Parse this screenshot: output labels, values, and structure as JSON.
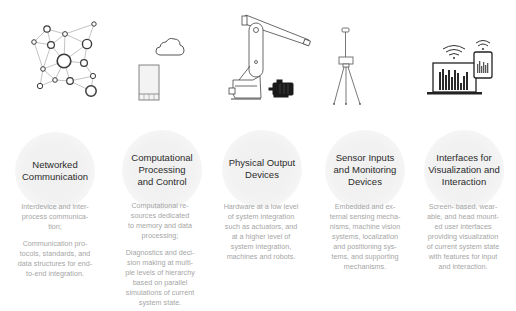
{
  "columns": [
    {
      "id": "networked",
      "icon": "network-graph-icon",
      "title": "Networked\nCommunication",
      "paragraphs": [
        "Interdevice and inter-\nprocess communica-\ntion;",
        "Communication pro-\ntocols, standards, and\ndata structures for end-\nto-end integration."
      ]
    },
    {
      "id": "computational",
      "icon": "cloud-server-icon",
      "title": "Computational\nProcessing\nand Control",
      "paragraphs": [
        "Computational re-\nsources dedicated\nto memory and data\nprocessing;",
        "Diagnostics and deci-\nsion making at multi-\nple levels of hierarchy\nbased on parallel\nsimulations of current\nsystem state."
      ]
    },
    {
      "id": "physical",
      "icon": "robot-arm-motor-icon",
      "title": "Physical Output\nDevices",
      "paragraphs": [
        "Hardware at a low level\nof system integration\nsuch as actuators, and\nat a higher level of\nsystem integration,\nmachines and robots."
      ]
    },
    {
      "id": "sensor",
      "icon": "tripod-sensor-icon",
      "title": "Sensor Inputs\nand Monitoring\nDevices",
      "paragraphs": [
        "Embedded and ex-\nternal sensing mecha-\nnisms, machine vision\nsystems, localization\nand positioning sys-\ntems, and supporting\nmechanisms."
      ]
    },
    {
      "id": "interfaces",
      "icon": "laptop-tablet-wireless-icon",
      "title": "Interfaces for\nVisualization and\nInteraction",
      "paragraphs": [
        "Screen- based, wear-\nable, and head mount-\ned user interfaces\nproviding visualization\nof current system state\nwith features for input\nand interaction."
      ]
    }
  ]
}
